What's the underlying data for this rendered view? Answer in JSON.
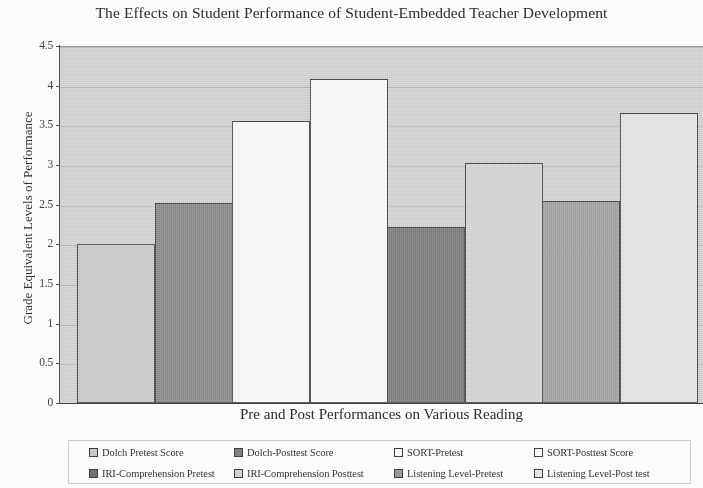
{
  "chart_data": {
    "type": "bar",
    "title": "The Effects on Student Performance of Student-Embedded Teacher Development",
    "xlabel": "Pre and Post Performances on Various Reading",
    "ylabel": "Grade Equivalent Levels of Performance",
    "ylim": [
      0,
      4.5
    ],
    "ytick_labels": [
      "0",
      "0.5",
      "1",
      "1.5",
      "2",
      "2.5",
      "3",
      "3.5",
      "4",
      "4.5"
    ],
    "ytick_values": [
      0,
      0.5,
      1,
      1.5,
      2,
      2.5,
      3,
      3.5,
      4,
      4.5
    ],
    "grid": true,
    "legend_position": "bottom",
    "categories": [
      "Dolch Pretest Score",
      "Dolch-Posttest Score",
      "SORT-Pretest",
      "SORT-Posttest Score",
      "IRI-Comprehension Pretest",
      "IRI-Comprehension Posttest",
      "Listening Level-Pretest",
      "Listening Level-Post test"
    ],
    "values": [
      2.0,
      2.52,
      3.55,
      4.08,
      2.22,
      3.03,
      2.55,
      3.66
    ],
    "colors": [
      "#c8c8c8",
      "#7d7d7d",
      "#ffffff",
      "#ffffff",
      "#6e6e6e",
      "#d4d4d4",
      "#9a9a9a",
      "#e6e6e6"
    ],
    "plot_background": "#d2d2d2",
    "bar_border_color": "#3a3a3a"
  },
  "legend": {
    "items": [
      {
        "label": "Dolch Pretest Score",
        "color": "#c8c8c8"
      },
      {
        "label": "Dolch-Posttest Score",
        "color": "#7d7d7d"
      },
      {
        "label": "SORT-Pretest",
        "color": "#ffffff"
      },
      {
        "label": "SORT-Posttest Score",
        "color": "#ffffff"
      },
      {
        "label": "IRI-Comprehension Pretest",
        "color": "#6e6e6e"
      },
      {
        "label": "IRI-Comprehension Posttest",
        "color": "#d4d4d4"
      },
      {
        "label": "Listening Level-Pretest",
        "color": "#9a9a9a"
      },
      {
        "label": "Listening Level-Post test",
        "color": "#e6e6e6"
      }
    ]
  }
}
